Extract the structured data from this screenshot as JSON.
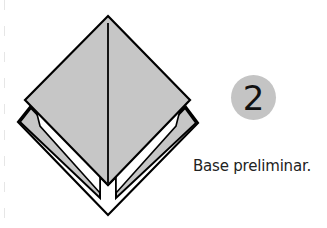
{
  "figure": {
    "paper_color": "#c6c6c6",
    "line_color": "#000000"
  },
  "step": {
    "number": "2",
    "badge_color": "#c4c4c4"
  },
  "caption": {
    "text": "Base preliminar."
  }
}
